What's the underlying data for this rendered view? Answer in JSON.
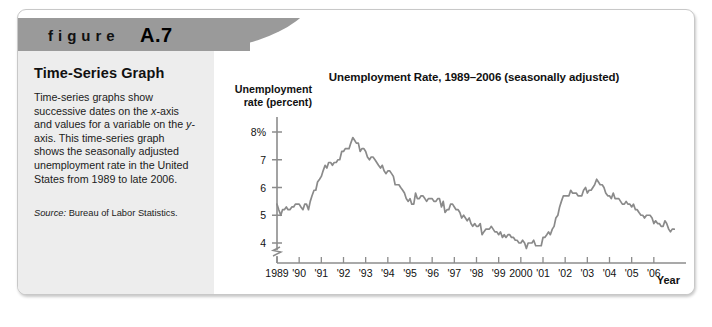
{
  "figure": {
    "label_word": "figure",
    "label_number": "A.7",
    "caption_title": "Time-Series Graph",
    "caption_body": "Time-series graphs show successive dates on the x-axis and values for a variable on the y-axis. This time-series graph shows the seasonally adjusted unemployment rate in the United States from 1989 to late 2006.",
    "source_label": "Source:",
    "source_text": " Bureau of Labor Statistics."
  },
  "colors": {
    "header_bar": "#9a9a9a",
    "caption_panel": "#ededed",
    "line": "#8a8a8a",
    "axis": "#8c8c8c",
    "text": "#111111"
  },
  "chart_data": {
    "type": "line",
    "title": "Unemployment Rate, 1989–2006 (seasonally adjusted)",
    "xlabel": "Year",
    "ylabel": "Unemployment rate (percent)",
    "ylim": [
      3.6,
      8.4
    ],
    "xlim": [
      1989,
      2007
    ],
    "grid": false,
    "legend": null,
    "axis_break_y": true,
    "ytick_labels": [
      "8%",
      "7",
      "6",
      "5",
      "4"
    ],
    "ytick_values": [
      8,
      7,
      6,
      5,
      4
    ],
    "xtick_labels": [
      "1989",
      "'90",
      "'91",
      "'92",
      "'93",
      "'94",
      "'95",
      "'96",
      "'97",
      "'98",
      "'99",
      "2000",
      "'01",
      "'02",
      "'03",
      "'04",
      "'05",
      "'06"
    ],
    "xtick_values": [
      1989,
      1990,
      1991,
      1992,
      1993,
      1994,
      1995,
      1996,
      1997,
      1998,
      1999,
      2000,
      2001,
      2002,
      2003,
      2004,
      2005,
      2006
    ],
    "series": [
      {
        "name": "Unemployment rate (seasonally adjusted)",
        "x": [
          1989.0,
          1989.08,
          1989.17,
          1989.25,
          1989.33,
          1989.42,
          1989.5,
          1989.58,
          1989.67,
          1989.75,
          1989.83,
          1989.92,
          1990.0,
          1990.08,
          1990.17,
          1990.25,
          1990.33,
          1990.42,
          1990.5,
          1990.58,
          1990.67,
          1990.75,
          1990.83,
          1990.92,
          1991.0,
          1991.08,
          1991.17,
          1991.25,
          1991.33,
          1991.42,
          1991.5,
          1991.58,
          1991.67,
          1991.75,
          1991.83,
          1991.92,
          1992.0,
          1992.08,
          1992.17,
          1992.25,
          1992.33,
          1992.42,
          1992.5,
          1992.58,
          1992.67,
          1992.75,
          1992.83,
          1992.92,
          1993.0,
          1993.08,
          1993.17,
          1993.25,
          1993.33,
          1993.42,
          1993.5,
          1993.58,
          1993.67,
          1993.75,
          1993.83,
          1993.92,
          1994.0,
          1994.08,
          1994.17,
          1994.25,
          1994.33,
          1994.42,
          1994.5,
          1994.58,
          1994.67,
          1994.75,
          1994.83,
          1994.92,
          1995.0,
          1995.08,
          1995.17,
          1995.25,
          1995.33,
          1995.42,
          1995.5,
          1995.58,
          1995.67,
          1995.75,
          1995.83,
          1995.92,
          1996.0,
          1996.08,
          1996.17,
          1996.25,
          1996.33,
          1996.42,
          1996.5,
          1996.58,
          1996.67,
          1996.75,
          1996.83,
          1996.92,
          1997.0,
          1997.08,
          1997.17,
          1997.25,
          1997.33,
          1997.42,
          1997.5,
          1997.58,
          1997.67,
          1997.75,
          1997.83,
          1997.92,
          1998.0,
          1998.08,
          1998.17,
          1998.25,
          1998.33,
          1998.42,
          1998.5,
          1998.58,
          1998.67,
          1998.75,
          1998.83,
          1998.92,
          1999.0,
          1999.08,
          1999.17,
          1999.25,
          1999.33,
          1999.42,
          1999.5,
          1999.58,
          1999.67,
          1999.75,
          1999.83,
          1999.92,
          2000.0,
          2000.08,
          2000.17,
          2000.25,
          2000.33,
          2000.42,
          2000.5,
          2000.58,
          2000.67,
          2000.75,
          2000.83,
          2000.92,
          2001.0,
          2001.08,
          2001.17,
          2001.25,
          2001.33,
          2001.42,
          2001.5,
          2001.58,
          2001.67,
          2001.75,
          2001.83,
          2001.92,
          2002.0,
          2002.08,
          2002.17,
          2002.25,
          2002.33,
          2002.42,
          2002.5,
          2002.58,
          2002.67,
          2002.75,
          2002.83,
          2002.92,
          2003.0,
          2003.08,
          2003.17,
          2003.25,
          2003.33,
          2003.42,
          2003.5,
          2003.58,
          2003.67,
          2003.75,
          2003.83,
          2003.92,
          2004.0,
          2004.08,
          2004.17,
          2004.25,
          2004.33,
          2004.42,
          2004.5,
          2004.58,
          2004.67,
          2004.75,
          2004.83,
          2004.92,
          2005.0,
          2005.08,
          2005.17,
          2005.25,
          2005.33,
          2005.42,
          2005.5,
          2005.58,
          2005.67,
          2005.75,
          2005.83,
          2005.92,
          2006.0,
          2006.08,
          2006.17,
          2006.25,
          2006.33,
          2006.42,
          2006.5,
          2006.58,
          2006.67,
          2006.75,
          2006.83,
          2006.92
        ],
        "values": [
          5.4,
          5.2,
          5.0,
          5.2,
          5.2,
          5.3,
          5.2,
          5.2,
          5.3,
          5.3,
          5.4,
          5.4,
          5.4,
          5.3,
          5.2,
          5.4,
          5.4,
          5.2,
          5.5,
          5.7,
          5.9,
          5.9,
          6.2,
          6.3,
          6.4,
          6.6,
          6.8,
          6.7,
          6.9,
          6.9,
          6.8,
          6.9,
          6.9,
          7.0,
          7.0,
          7.3,
          7.3,
          7.4,
          7.4,
          7.4,
          7.6,
          7.8,
          7.7,
          7.6,
          7.6,
          7.3,
          7.4,
          7.4,
          7.3,
          7.1,
          7.0,
          7.1,
          7.1,
          7.0,
          6.9,
          6.8,
          6.7,
          6.8,
          6.6,
          6.5,
          6.6,
          6.6,
          6.5,
          6.4,
          6.1,
          6.1,
          6.1,
          6.0,
          5.9,
          5.8,
          5.6,
          5.5,
          5.6,
          5.4,
          5.4,
          5.8,
          5.6,
          5.6,
          5.7,
          5.7,
          5.6,
          5.5,
          5.6,
          5.6,
          5.6,
          5.5,
          5.5,
          5.6,
          5.6,
          5.3,
          5.5,
          5.1,
          5.2,
          5.2,
          5.4,
          5.4,
          5.3,
          5.2,
          5.2,
          5.1,
          4.9,
          5.0,
          4.9,
          4.8,
          4.9,
          4.7,
          4.6,
          4.7,
          4.6,
          4.6,
          4.7,
          4.3,
          4.4,
          4.5,
          4.5,
          4.5,
          4.6,
          4.5,
          4.4,
          4.4,
          4.3,
          4.4,
          4.2,
          4.3,
          4.2,
          4.3,
          4.3,
          4.2,
          4.2,
          4.1,
          4.1,
          4.0,
          4.0,
          4.1,
          4.0,
          3.8,
          4.0,
          4.0,
          4.0,
          4.1,
          3.9,
          3.9,
          3.9,
          3.9,
          4.2,
          4.2,
          4.3,
          4.4,
          4.3,
          4.5,
          4.6,
          4.9,
          5.0,
          5.3,
          5.5,
          5.7,
          5.7,
          5.7,
          5.7,
          5.9,
          5.8,
          5.8,
          5.8,
          5.7,
          5.7,
          5.7,
          5.9,
          6.0,
          5.8,
          5.9,
          5.9,
          6.0,
          6.1,
          6.3,
          6.2,
          6.1,
          6.1,
          6.0,
          5.8,
          5.7,
          5.7,
          5.6,
          5.8,
          5.6,
          5.6,
          5.6,
          5.5,
          5.4,
          5.4,
          5.5,
          5.4,
          5.4,
          5.3,
          5.4,
          5.2,
          5.2,
          5.1,
          5.0,
          5.0,
          4.9,
          5.0,
          5.0,
          5.0,
          4.9,
          4.7,
          4.8,
          4.7,
          4.7,
          4.6,
          4.6,
          4.8,
          4.7,
          4.5,
          4.4,
          4.5,
          4.5
        ]
      }
    ]
  }
}
